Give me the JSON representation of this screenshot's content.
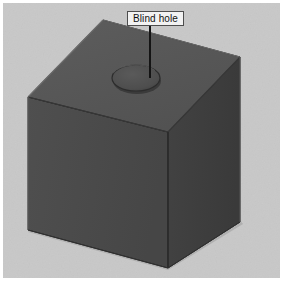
{
  "figure": {
    "title": "Blind hole",
    "canvas": {
      "width": 283,
      "height": 281
    },
    "background_color": "#c8c8c8",
    "border_color": "#ffffff",
    "annotation": {
      "label": "Blind hole",
      "label_box": {
        "fill": "#f2f2f2",
        "stroke": "#4d4d4d",
        "text_color": "#111111",
        "x": 127,
        "y": 11,
        "width": 57,
        "height": 15
      },
      "leader_line": {
        "color": "#141414",
        "x1": 150,
        "y1": 26,
        "x2": 150,
        "y2": 78,
        "width": 2
      }
    },
    "solid": {
      "name": "rectangular-block",
      "shading": {
        "top_face": "#585858",
        "left_face": "#4b4b4b",
        "right_face": "#3f3f3f",
        "edge_color": "#2a2a2a",
        "highlight_edge": "#7a7a7a"
      },
      "vertices": {
        "back_top": [
          103,
          20
        ],
        "left_top": [
          28,
          97
        ],
        "right_top": [
          240,
          57
        ],
        "front_top": [
          168,
          132
        ],
        "left_bottom": [
          28,
          230
        ],
        "front_bottom": [
          168,
          268
        ],
        "right_bottom": [
          240,
          222
        ]
      }
    },
    "feature": {
      "name": "blind-hole",
      "type": "cylindrical-recess",
      "ellipse": {
        "cx": 136,
        "cy": 78,
        "rx": 24,
        "ry": 13
      },
      "rim_color": "#2e2e2e",
      "bore_color": "#4f4f4f",
      "bottom_color": "#565656"
    }
  }
}
